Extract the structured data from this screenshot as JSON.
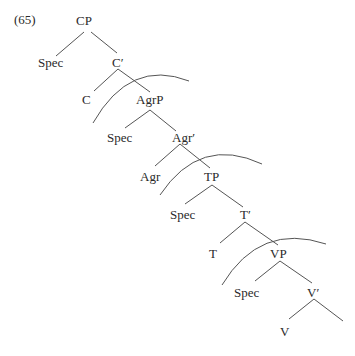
{
  "example_number": "(65)",
  "nodes": {
    "cp": "CP",
    "spec_cp": "Spec",
    "c_bar": "C′",
    "c": "C",
    "agrp": "AgrP",
    "spec_agrp": "Spec",
    "agr_bar": "Agr′",
    "agr": "Agr",
    "tp": "TP",
    "spec_tp": "Spec",
    "t_bar": "T′",
    "t": "T",
    "vp": "VP",
    "spec_vp": "Spec",
    "v_bar": "V′",
    "v": "V"
  },
  "arcs_count": 3
}
